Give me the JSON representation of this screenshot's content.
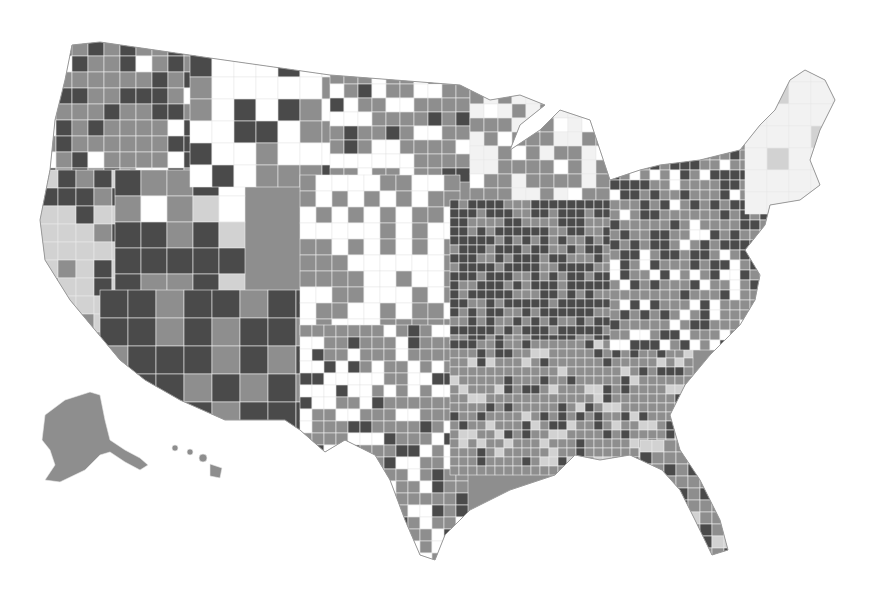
{
  "map": {
    "type": "choropleth",
    "region": "United States counties",
    "title": "",
    "legend": null,
    "shades": [
      "#ffffff",
      "#d2d2d2",
      "#8e8e8e",
      "#4a4a4a",
      "#f2f2f2"
    ],
    "shade_labels": [
      "no data / lowest",
      "low",
      "medium",
      "high",
      "very low"
    ],
    "regions": [
      {
        "name": "Pacific Northwest",
        "levels": [
          2,
          3,
          2,
          3,
          0,
          2
        ]
      },
      {
        "name": "California",
        "levels": [
          1,
          1,
          3,
          2,
          1,
          3
        ]
      },
      {
        "name": "Great Basin",
        "levels": [
          3,
          3,
          2,
          3,
          0,
          1
        ]
      },
      {
        "name": "Northern Rockies",
        "levels": [
          0,
          2,
          0,
          3,
          2,
          0
        ]
      },
      {
        "name": "Southwest",
        "levels": [
          3,
          3,
          2,
          3,
          3,
          2
        ]
      },
      {
        "name": "Northern Plains",
        "levels": [
          2,
          0,
          2,
          0,
          2,
          3
        ]
      },
      {
        "name": "Central Plains",
        "levels": [
          0,
          2,
          0,
          2,
          2,
          0
        ]
      },
      {
        "name": "Texas",
        "levels": [
          2,
          0,
          2,
          2,
          0,
          3
        ]
      },
      {
        "name": "Upper Midwest",
        "levels": [
          2,
          4,
          0,
          2,
          4,
          2
        ]
      },
      {
        "name": "Ohio Valley",
        "levels": [
          3,
          2,
          3,
          3,
          2,
          3
        ]
      },
      {
        "name": "Southeast",
        "levels": [
          2,
          2,
          3,
          2,
          2,
          1
        ]
      },
      {
        "name": "Mid-Atlantic",
        "levels": [
          2,
          3,
          2,
          0,
          3,
          2
        ]
      },
      {
        "name": "New England",
        "levels": [
          4,
          4,
          4,
          4,
          1,
          4
        ]
      },
      {
        "name": "Florida",
        "levels": [
          2,
          3,
          1,
          2,
          3,
          2
        ]
      },
      {
        "name": "Alaska",
        "levels": [
          2
        ]
      },
      {
        "name": "Hawaii",
        "levels": [
          2
        ]
      }
    ]
  }
}
